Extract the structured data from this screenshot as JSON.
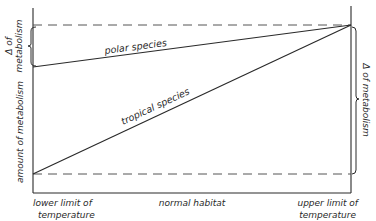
{
  "diagram": {
    "title": "",
    "colors": {
      "ink": "#2a2a2a",
      "dash": "#555555",
      "background": "#ffffff"
    },
    "series": [
      {
        "name": "polar species",
        "label": "polar species",
        "start": {
          "x": 33,
          "y": 67
        },
        "end": {
          "x": 351,
          "y": 25
        }
      },
      {
        "name": "tropical species",
        "label": "tropical species",
        "start": {
          "x": 33,
          "y": 174
        },
        "end": {
          "x": 351,
          "y": 25
        }
      }
    ],
    "reference_lines": [
      {
        "name": "upper-dashed",
        "y": 25
      },
      {
        "name": "lower-dashed",
        "y": 174
      }
    ],
    "y_axis_label": "amount of metabolism",
    "left_bracket_label_line1": "Δ of",
    "left_bracket_label_line2": "metabolism",
    "right_bracket_label": "Δ of metabolism",
    "x_labels": {
      "left_line1": "lower limit of",
      "left_line2": "temperature",
      "center": "normal habitat",
      "right_line1": "upper limit of",
      "right_line2": "temperature"
    }
  }
}
